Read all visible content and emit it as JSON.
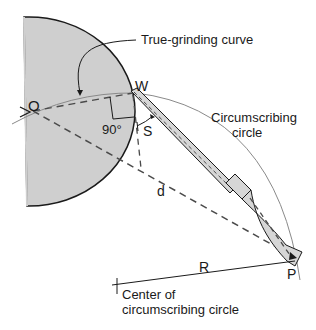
{
  "diagram": {
    "labels": {
      "true_grinding_curve": "True-grinding curve",
      "point_w": "W",
      "point_o": "O",
      "angle_90": "90°",
      "s": "S",
      "circumscribing_1": "Circumscribing",
      "circumscribing_2": "circle",
      "d": "d",
      "r": "R",
      "point_p": "P",
      "center_1": "Center of",
      "center_2": "circumscribing circle"
    },
    "colors": {
      "wheel_fill": "#cfcfcf",
      "outline": "#1a1a1a",
      "thin_line": "#8a8a8a",
      "tool_fill": "#d6d6d6",
      "dash": "#4a4a4a"
    }
  }
}
